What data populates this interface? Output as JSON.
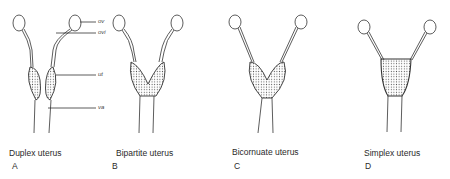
{
  "figures": [
    {
      "caption": "Duplex uterus",
      "letter": "A"
    },
    {
      "caption": "Bipartite uterus",
      "letter": "B"
    },
    {
      "caption": "Bicornuate uterus",
      "letter": "C"
    },
    {
      "caption": "Simplex uterus",
      "letter": "D"
    }
  ],
  "anatomy_labels": {
    "ov": "ov",
    "ovi": "ovi",
    "ut": "ut",
    "va": "va"
  },
  "colors": {
    "line": "#333333",
    "stipple": "#555555"
  }
}
